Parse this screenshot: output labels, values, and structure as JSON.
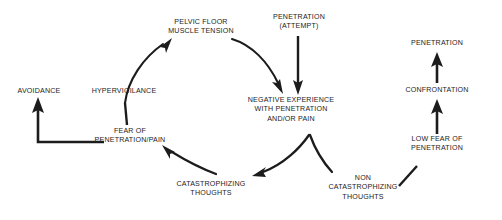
{
  "diagram": {
    "background_color": "#ffffff",
    "stroke_color": "#1c1c1c",
    "text_color": "#1c1c1c",
    "width": 502,
    "height": 220,
    "nodes": [
      {
        "id": "avoidance",
        "label": "AVOIDANCE",
        "x": 39,
        "y": 92
      },
      {
        "id": "hypervigilance",
        "label": "HYPERVIGILANCE",
        "x": 124,
        "y": 92
      },
      {
        "id": "pelvic-floor",
        "label": "PELVIC FLOOR\nMUSCLE TENSION",
        "x": 201,
        "y": 27
      },
      {
        "id": "penetration-attempt",
        "label": "PENETRATION\n(ATTEMPT)",
        "x": 299,
        "y": 22
      },
      {
        "id": "negative-experience",
        "label": "NEGATIVE EXPERIENCE\nWITH PENETRATION\nAND/OR PAIN",
        "x": 291,
        "y": 110
      },
      {
        "id": "fear-of-penetration",
        "label": "FEAR OF\nPENETRATION/PAIN",
        "x": 130,
        "y": 136
      },
      {
        "id": "catastrophizing",
        "label": "CATASTROPHIZING\nTHOUGHTS",
        "x": 211,
        "y": 189
      },
      {
        "id": "non-catastrophizing",
        "label": "NON\nCATASTROPHIZING\nTHOUGHTS",
        "x": 363,
        "y": 188
      },
      {
        "id": "low-fear",
        "label": "LOW FEAR OF\nPENETRATION",
        "x": 437,
        "y": 144
      },
      {
        "id": "confrontation",
        "label": "CONFRONTATION",
        "x": 437,
        "y": 91
      },
      {
        "id": "penetration",
        "label": "PENETRATION",
        "x": 437,
        "y": 44
      }
    ],
    "edges": [
      {
        "id": "hypervigilance-to-pelvic-floor",
        "from": "hypervigilance",
        "to": "pelvic-floor",
        "style": "curved",
        "arrowhead": true
      },
      {
        "id": "pelvic-floor-to-negative-experience",
        "from": "pelvic-floor",
        "to": "negative-experience",
        "style": "curved",
        "arrowhead": true
      },
      {
        "id": "attempt-to-negative-experience",
        "from": "penetration-attempt",
        "to": "negative-experience",
        "style": "straight",
        "arrowhead": true
      },
      {
        "id": "negative-experience-to-catastrophizing",
        "from": "negative-experience",
        "to": "catastrophizing",
        "style": "curved",
        "arrowhead": true
      },
      {
        "id": "negative-experience-to-non-catastrophizing",
        "from": "negative-experience",
        "to": "non-catastrophizing",
        "style": "curved",
        "arrowhead": false
      },
      {
        "id": "catastrophizing-to-fear",
        "from": "catastrophizing",
        "to": "fear-of-penetration",
        "style": "curved",
        "arrowhead": true
      },
      {
        "id": "fear-to-hypervigilance",
        "from": "fear-of-penetration",
        "to": "hypervigilance",
        "style": "straight",
        "arrowhead": false
      },
      {
        "id": "fear-to-avoidance",
        "from": "fear-of-penetration",
        "to": "avoidance",
        "style": "elbow",
        "arrowhead": true
      },
      {
        "id": "non-catastrophizing-to-low-fear",
        "from": "non-catastrophizing",
        "to": "low-fear",
        "style": "straight",
        "arrowhead": false
      },
      {
        "id": "low-fear-to-confrontation",
        "from": "low-fear",
        "to": "confrontation",
        "style": "straight",
        "arrowhead": true
      },
      {
        "id": "confrontation-to-penetration",
        "from": "confrontation",
        "to": "penetration",
        "style": "straight",
        "arrowhead": true
      }
    ]
  }
}
